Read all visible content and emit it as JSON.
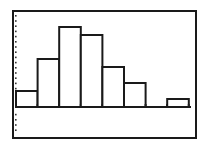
{
  "chart_data": {
    "type": "bar",
    "subtype": "histogram",
    "title": "",
    "xlabel": "",
    "ylabel": "",
    "categories": [
      "1",
      "2",
      "3",
      "4",
      "5",
      "6",
      "7",
      "8"
    ],
    "values": [
      2,
      6,
      10,
      9,
      5,
      3,
      0,
      1
    ],
    "ylim": [
      -3,
      12
    ],
    "grid": false,
    "legend": "none",
    "y_axis_style": "dotted",
    "colors": {
      "bar_fill": "#ffffff",
      "bar_stroke": "#1a1a1a",
      "frame": "#1a1a1a",
      "background": "#ffffff"
    }
  }
}
